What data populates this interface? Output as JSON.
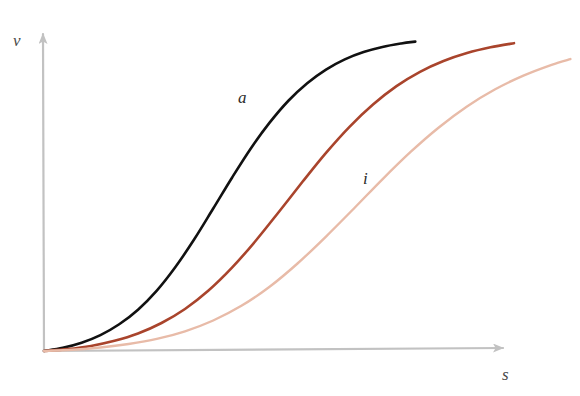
{
  "chart_data": {
    "type": "line",
    "title": "",
    "subtitle": "",
    "xlabel": "s",
    "ylabel": "v",
    "xlim": [
      0,
      1
    ],
    "ylim": [
      0,
      1
    ],
    "grid": false,
    "legend_position": "inline-curve-labels",
    "axis_style": "arrow",
    "axis_color": "#c2c2c2",
    "tick_labels_x": [],
    "tick_labels_y": [],
    "annotations": [
      {
        "text": "a",
        "attached_to": "a",
        "x": 0.43,
        "y": 0.73
      },
      {
        "text": "i",
        "attached_to": "i",
        "x": 0.68,
        "y": 0.51
      }
    ],
    "series": [
      {
        "name": "a",
        "label": "a",
        "color": "#111111",
        "width": 2.6,
        "points": [
          [
            0.0,
            0.0
          ],
          [
            0.04,
            0.01
          ],
          [
            0.08,
            0.026
          ],
          [
            0.12,
            0.05
          ],
          [
            0.16,
            0.084
          ],
          [
            0.2,
            0.13
          ],
          [
            0.24,
            0.19
          ],
          [
            0.28,
            0.265
          ],
          [
            0.32,
            0.352
          ],
          [
            0.36,
            0.448
          ],
          [
            0.4,
            0.545
          ],
          [
            0.44,
            0.637
          ],
          [
            0.48,
            0.718
          ],
          [
            0.52,
            0.787
          ],
          [
            0.56,
            0.842
          ],
          [
            0.6,
            0.885
          ],
          [
            0.64,
            0.917
          ],
          [
            0.68,
            0.94
          ],
          [
            0.72,
            0.956
          ],
          [
            0.76,
            0.967
          ],
          [
            0.79,
            0.973
          ]
        ]
      },
      {
        "name": "mid",
        "label": "",
        "color": "#a9442c",
        "width": 2.6,
        "points": [
          [
            0.0,
            0.0
          ],
          [
            0.05,
            0.006
          ],
          [
            0.1,
            0.016
          ],
          [
            0.15,
            0.032
          ],
          [
            0.2,
            0.055
          ],
          [
            0.25,
            0.088
          ],
          [
            0.3,
            0.132
          ],
          [
            0.35,
            0.19
          ],
          [
            0.4,
            0.262
          ],
          [
            0.45,
            0.346
          ],
          [
            0.5,
            0.438
          ],
          [
            0.55,
            0.532
          ],
          [
            0.6,
            0.623
          ],
          [
            0.65,
            0.705
          ],
          [
            0.7,
            0.775
          ],
          [
            0.75,
            0.833
          ],
          [
            0.8,
            0.878
          ],
          [
            0.85,
            0.912
          ],
          [
            0.9,
            0.937
          ],
          [
            0.95,
            0.955
          ],
          [
            1.0,
            0.968
          ]
        ]
      },
      {
        "name": "i",
        "label": "i",
        "color": "#e8bba8",
        "width": 2.4,
        "points": [
          [
            0.0,
            0.0
          ],
          [
            0.06,
            0.004
          ],
          [
            0.12,
            0.011
          ],
          [
            0.18,
            0.022
          ],
          [
            0.24,
            0.038
          ],
          [
            0.3,
            0.062
          ],
          [
            0.36,
            0.096
          ],
          [
            0.42,
            0.142
          ],
          [
            0.48,
            0.202
          ],
          [
            0.54,
            0.276
          ],
          [
            0.6,
            0.36
          ],
          [
            0.66,
            0.449
          ],
          [
            0.72,
            0.54
          ],
          [
            0.78,
            0.626
          ],
          [
            0.84,
            0.703
          ],
          [
            0.9,
            0.769
          ],
          [
            0.96,
            0.823
          ],
          [
            1.02,
            0.866
          ],
          [
            1.08,
            0.9
          ],
          [
            1.12,
            0.918
          ]
        ]
      }
    ]
  },
  "axes": {
    "y_label": "v",
    "x_label": "s",
    "origin_px": [
      44,
      351
    ],
    "y_tip_px": [
      43,
      28
    ],
    "x_tip_px": [
      513,
      348
    ]
  },
  "labels": {
    "curve_a": "a",
    "curve_i": "i"
  }
}
